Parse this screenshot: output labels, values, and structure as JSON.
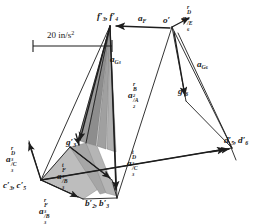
{
  "figure": {
    "kind": "acceleration-polygon",
    "title": "",
    "scale": {
      "value": "20",
      "unit": "in/s",
      "exponent": "2",
      "full_label": "20 in/s2",
      "bar_x1": 33,
      "bar_x2": 112,
      "bar_y": 46
    },
    "colors": {
      "line": "#1d1d1d",
      "label": "#1a1a1a",
      "shade_dark": "#8d8d8d",
      "shade_mid": "#a8a8a8",
      "shade_light": "#c2c2c2",
      "background": "#ffffff"
    },
    "points": [
      {
        "id": "o-prime",
        "label_base": "o",
        "primes": "'",
        "x": 172,
        "y": 27
      },
      {
        "id": "f3f4-prime",
        "label_base": "f",
        "primes": "'",
        "x": 110,
        "y": 26
      },
      {
        "id": "g6-prime",
        "label_base": "g",
        "primes": "'",
        "x": 186,
        "y": 101
      },
      {
        "id": "g3-prime",
        "label_base": "g",
        "primes": "'",
        "x": 79,
        "y": 147
      },
      {
        "id": "d5d6-prime",
        "label_base": "d",
        "primes": "'",
        "x": 232,
        "y": 148
      },
      {
        "id": "c3c5-prime",
        "label_base": "c",
        "primes": "'",
        "x": 41,
        "y": 180
      },
      {
        "id": "b2b3-prime",
        "label_base": "b",
        "primes": "'",
        "x": 117,
        "y": 198
      }
    ],
    "labels": [
      {
        "id": "label-f3-f4",
        "name": "label-f3-f4-prime",
        "text": "f'3, f'4",
        "base": "f",
        "x": 97,
        "y": 12,
        "size": 9.2
      },
      {
        "id": "label-a-F",
        "name": "label-a-F",
        "text": "aF",
        "base": "a",
        "x": 138,
        "y": 14,
        "size": 9.2
      },
      {
        "id": "label-o-prime",
        "name": "label-o-prime",
        "text": "o'",
        "base": "o",
        "x": 164,
        "y": 17,
        "size": 9.2
      },
      {
        "id": "label-a-r-D6-E6",
        "name": "label-a-r-D6-E6",
        "text": "arD6/E6",
        "base": "a",
        "x": 181,
        "y": 6,
        "size": 9.2
      },
      {
        "id": "label-a-G3",
        "name": "label-a-G3",
        "text": "aG3",
        "base": "a",
        "x": 111,
        "y": 57,
        "size": 9.2
      },
      {
        "id": "label-a-G6",
        "name": "label-a-G6",
        "text": "aG6",
        "base": "a",
        "x": 197,
        "y": 62,
        "size": 9.2
      },
      {
        "id": "label-a-r-B2-A2",
        "name": "label-a-r-B2-A2",
        "text": "arB2/A2",
        "base": "a",
        "x": 129,
        "y": 84,
        "size": 9.2
      },
      {
        "id": "label-g6-prime",
        "name": "label-g6-prime",
        "text": "g'6",
        "base": "g",
        "x": 179,
        "y": 88,
        "size": 9.2
      },
      {
        "id": "label-a-t-D3-C3",
        "name": "label-a-t-D3-C3",
        "text": "atD3/C3",
        "base": "a",
        "x": 127,
        "y": 151,
        "size": 9.2
      },
      {
        "id": "label-d5-d6",
        "name": "label-d5-d6-prime",
        "text": "d'5, d'6",
        "base": "d",
        "x": 226,
        "y": 140,
        "size": 9.2
      },
      {
        "id": "label-a-r-D3-C3",
        "name": "label-a-r-D3-C3",
        "text": "arD3/C3",
        "base": "a",
        "x": 6,
        "y": 147,
        "size": 9.2
      },
      {
        "id": "label-g3-prime",
        "name": "label-g3-prime",
        "text": "g'3",
        "base": "g",
        "x": 66,
        "y": 139,
        "size": 9.2
      },
      {
        "id": "label-a-t-F3-B3",
        "name": "label-a-t-F3-B3",
        "text": "atF3/B3",
        "base": "a",
        "x": 57,
        "y": 164,
        "size": 9.2
      },
      {
        "id": "label-c3-c5",
        "name": "label-c3-c5-prime",
        "text": "c'3, c'5",
        "base": "c",
        "x": 3,
        "y": 181,
        "size": 9.2
      },
      {
        "id": "label-a-r-F3-B3",
        "name": "label-a-r-F3-B3",
        "text": "arF3/B3",
        "base": "a",
        "x": 39,
        "y": 199,
        "size": 9.2
      },
      {
        "id": "label-b2-b3",
        "name": "label-b2-b3-prime",
        "text": "b'2, b'3",
        "base": "b",
        "x": 85,
        "y": 199,
        "size": 9.2
      }
    ],
    "vectors": [
      {
        "name": "vector-aF",
        "from": "o-prime",
        "to": "f3f4-prime"
      },
      {
        "name": "vector-a-r-D6-E6",
        "from": "o-prime",
        "to": "d5d6-prime"
      },
      {
        "name": "vector-a-G6",
        "from": "o-prime",
        "to": "g6-prime"
      },
      {
        "name": "vector-a-t-D3-C3",
        "from": "c3c5-prime",
        "to": "d5d6-prime"
      },
      {
        "name": "vector-a-r-D3-C3",
        "from": "c3c5-prime",
        "to": "f3f4-prime"
      },
      {
        "name": "vector-a-r-F3-B3",
        "from": "c3c5-prime",
        "to": "b2b3-prime"
      },
      {
        "name": "vector-a-G3",
        "from": "f3f4-prime",
        "to": "g3-prime"
      },
      {
        "name": "vector-a-r-B2-A2",
        "from": "f3f4-prime",
        "to": "b2b3-prime"
      }
    ]
  }
}
